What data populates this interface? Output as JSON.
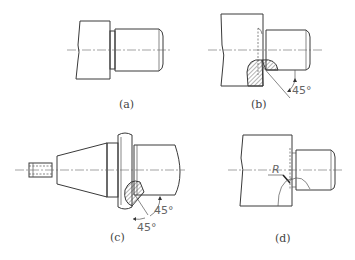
{
  "figures": [
    {
      "id": "a",
      "caption": "(a)"
    },
    {
      "id": "b",
      "caption": "(b)",
      "angle_label": "45°"
    },
    {
      "id": "c",
      "caption": "(c)",
      "angle_labels": [
        "45°",
        "45°"
      ]
    },
    {
      "id": "d",
      "caption": "(d)",
      "radius_label": "R"
    }
  ],
  "colors": {
    "line": "#3a3a3a",
    "text": "#444444",
    "background": "#ffffff"
  }
}
